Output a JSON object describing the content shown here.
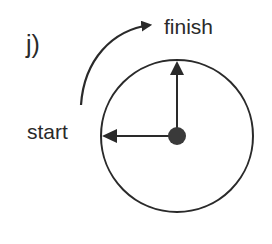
{
  "panel_label": "j)",
  "labels": {
    "finish": "finish",
    "start": "start"
  },
  "colors": {
    "stroke": "#2a2a2a",
    "center_dot": "#3a3a3a",
    "background": "#ffffff"
  },
  "geometry": {
    "circle": {
      "cx": 177,
      "cy": 136,
      "r": 76
    },
    "center_dot_r": 9,
    "rotation_arrow": {
      "from": "start",
      "to": "finish",
      "direction": "clockwise"
    }
  }
}
